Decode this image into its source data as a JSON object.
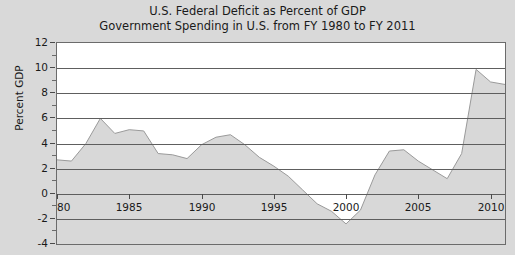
{
  "chart_data": {
    "type": "area",
    "title": "U.S. Federal Deficit as Percent of GDP",
    "subtitle": "Government Spending in U.S. from FY 1980 to FY 2011",
    "title_lines": [
      "U.S. Federal Deficit as Percent of GDP",
      "Government Spending in U.S. from FY 1980 to FY 2011"
    ],
    "xlabel": "",
    "ylabel": "Percent GDP",
    "xlim": [
      1980,
      2011
    ],
    "ylim": [
      -4,
      12
    ],
    "grid": true,
    "legend": "none",
    "yticks": [
      12,
      10,
      8,
      6,
      4,
      2,
      0,
      -2,
      -4
    ],
    "ytick_labels": [
      "12",
      "10",
      "8",
      "6",
      "4",
      "2",
      "0",
      "-2",
      "-4"
    ],
    "yminor_ticks": [
      11,
      9,
      7,
      5,
      3,
      1,
      -1,
      -3
    ],
    "xticks": [
      1980,
      1985,
      1990,
      1995,
      2000,
      2005,
      2010
    ],
    "xtick_labels": [
      "1980",
      "1985",
      "1990",
      "1995",
      "2000",
      "2005",
      "2010"
    ],
    "series_name": "Federal deficit (percent of GDP)",
    "baseline": -4,
    "x": [
      1980,
      1981,
      1982,
      1983,
      1984,
      1985,
      1986,
      1987,
      1988,
      1989,
      1990,
      1991,
      1992,
      1993,
      1994,
      1995,
      1996,
      1997,
      1998,
      1999,
      2000,
      2001,
      2002,
      2003,
      2004,
      2005,
      2006,
      2007,
      2008,
      2009,
      2010,
      2011
    ],
    "values": [
      2.7,
      2.6,
      4.0,
      6.0,
      4.8,
      5.1,
      5.0,
      3.2,
      3.1,
      2.8,
      3.9,
      4.5,
      4.7,
      3.9,
      2.9,
      2.2,
      1.4,
      0.3,
      -0.8,
      -1.4,
      -2.4,
      -1.3,
      1.5,
      3.4,
      3.5,
      2.6,
      1.9,
      1.2,
      3.2,
      9.9,
      8.9,
      8.7
    ],
    "peak_1983": 6.0,
    "peak_1992": 4.7,
    "trough_2000": -2.4,
    "peak_2004": 3.5,
    "peak_2009": 9.9,
    "value_2011": 8.7,
    "colors": {
      "area_fill": "#d8d8d8",
      "line": "#9a9a9a",
      "gridline": "#5e5e5e",
      "plot_background": "#ffffff",
      "page_background": "#d9d9d9",
      "frame_border": "#6b6b6b",
      "text": "#1a1a1a"
    }
  }
}
